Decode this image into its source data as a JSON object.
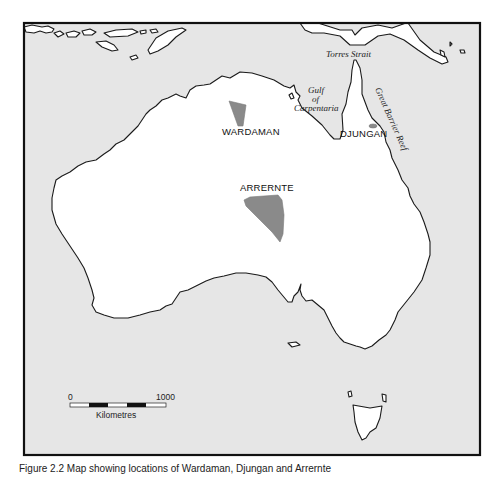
{
  "map": {
    "title": "Map of Australia showing language regions",
    "colors": {
      "sea": "#e6e6e6",
      "land": "#ffffff",
      "region_fill": "#8a8a8a",
      "frame": "#111111"
    },
    "regions": [
      {
        "name": "WARDAMAN",
        "label": "WARDAMAN"
      },
      {
        "name": "DJUNGAN",
        "label": "DJUNGAN"
      },
      {
        "name": "ARRERNTE",
        "label": "ARRERNTE"
      }
    ],
    "geographic_labels": {
      "torres_strait": "Torres Strait",
      "gulf_line1": "Gulf",
      "gulf_line2": "of",
      "gulf_line3": "Carpentaria",
      "great_barrier_reef": "Great Barrier Reef"
    },
    "scale_bar": {
      "start_label": "0",
      "end_label": "1000",
      "unit_label": "Kilometres"
    }
  },
  "caption": {
    "text": "Figure 2.2  Map showing locations of Wardaman, Djungan and Arrernte"
  }
}
